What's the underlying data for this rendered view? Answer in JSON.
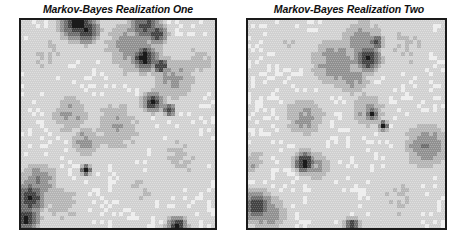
{
  "figure": {
    "panels": [
      {
        "title": "Markov-Bayes Realization One",
        "frame": {
          "left": 19,
          "width": 198,
          "height": 212
        },
        "grid": {
          "cols": 49,
          "rows": 52,
          "seed": 11
        },
        "blobs": [
          {
            "x": 14,
            "y": 0,
            "r": 3.5,
            "v": 0.95
          },
          {
            "x": 16,
            "y": 2,
            "r": 2.5,
            "v": 0.9
          },
          {
            "x": 31,
            "y": 1,
            "r": 3.0,
            "v": 0.75
          },
          {
            "x": 34,
            "y": 3,
            "r": 2.0,
            "v": 0.8
          },
          {
            "x": 31,
            "y": 9,
            "r": 2.5,
            "v": 0.95
          },
          {
            "x": 35,
            "y": 11,
            "r": 1.5,
            "v": 0.85
          },
          {
            "x": 33,
            "y": 20,
            "r": 2.0,
            "v": 0.85
          },
          {
            "x": 37,
            "y": 22,
            "r": 1.2,
            "v": 0.8
          },
          {
            "x": 28,
            "y": 6,
            "r": 6.0,
            "v": 0.45
          },
          {
            "x": 38,
            "y": 14,
            "r": 5.0,
            "v": 0.4
          },
          {
            "x": 24,
            "y": 26,
            "r": 6.0,
            "v": 0.35
          },
          {
            "x": 12,
            "y": 23,
            "r": 4.0,
            "v": 0.4
          },
          {
            "x": 16,
            "y": 30,
            "r": 3.0,
            "v": 0.45
          },
          {
            "x": 44,
            "y": 10,
            "r": 4.0,
            "v": 0.3
          },
          {
            "x": 2,
            "y": 44,
            "r": 3.0,
            "v": 0.85
          },
          {
            "x": 1,
            "y": 49,
            "r": 2.5,
            "v": 0.9
          },
          {
            "x": 4,
            "y": 40,
            "r": 4.0,
            "v": 0.5
          },
          {
            "x": 16,
            "y": 37,
            "r": 1.0,
            "v": 0.95
          },
          {
            "x": 39,
            "y": 51,
            "r": 1.8,
            "v": 0.95
          },
          {
            "x": 6,
            "y": 8,
            "r": 5.0,
            "v": 0.25
          },
          {
            "x": 40,
            "y": 34,
            "r": 6.0,
            "v": 0.25
          },
          {
            "x": 10,
            "y": 45,
            "r": 5.0,
            "v": 0.3
          },
          {
            "x": 30,
            "y": 42,
            "r": 5.0,
            "v": 0.22
          }
        ]
      },
      {
        "title": "Markov-Bayes Realization Two",
        "frame": {
          "left": 246,
          "width": 201,
          "height": 212
        },
        "grid": {
          "cols": 50,
          "rows": 52,
          "seed": 29
        },
        "blobs": [
          {
            "x": 32,
            "y": 5,
            "r": 1.5,
            "v": 0.85
          },
          {
            "x": 30,
            "y": 9,
            "r": 2.5,
            "v": 0.95
          },
          {
            "x": 29,
            "y": 5,
            "r": 4.5,
            "v": 0.45
          },
          {
            "x": 22,
            "y": 10,
            "r": 5.0,
            "v": 0.5
          },
          {
            "x": 26,
            "y": 14,
            "r": 3.5,
            "v": 0.45
          },
          {
            "x": 30,
            "y": 22,
            "r": 4.0,
            "v": 0.4
          },
          {
            "x": 31,
            "y": 23,
            "r": 1.2,
            "v": 0.9
          },
          {
            "x": 34,
            "y": 26,
            "r": 1.0,
            "v": 0.85
          },
          {
            "x": 14,
            "y": 24,
            "r": 4.5,
            "v": 0.4
          },
          {
            "x": 14,
            "y": 35,
            "r": 2.0,
            "v": 0.95
          },
          {
            "x": 17,
            "y": 36,
            "r": 3.5,
            "v": 0.4
          },
          {
            "x": 2,
            "y": 46,
            "r": 3.0,
            "v": 0.8
          },
          {
            "x": 5,
            "y": 48,
            "r": 4.0,
            "v": 0.45
          },
          {
            "x": 1,
            "y": 35,
            "r": 3.0,
            "v": 0.35
          },
          {
            "x": 45,
            "y": 31,
            "r": 4.5,
            "v": 0.5
          },
          {
            "x": 26,
            "y": 51,
            "r": 1.5,
            "v": 0.85
          },
          {
            "x": 40,
            "y": 6,
            "r": 6.0,
            "v": 0.25
          },
          {
            "x": 10,
            "y": 6,
            "r": 5.0,
            "v": 0.2
          },
          {
            "x": 38,
            "y": 44,
            "r": 6.0,
            "v": 0.25
          },
          {
            "x": 20,
            "y": 46,
            "r": 5.0,
            "v": 0.2
          }
        ]
      }
    ]
  }
}
